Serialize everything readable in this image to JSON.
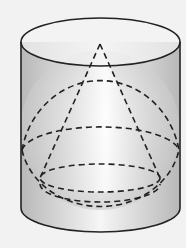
{
  "diagram": {
    "colors": {
      "background": "#f2f2f2",
      "stroke": "#222222",
      "fill_light": "#ffffff",
      "fill_dark": "#b8b8b8"
    },
    "shapes": [
      "cylinder",
      "sphere",
      "cone"
    ]
  }
}
